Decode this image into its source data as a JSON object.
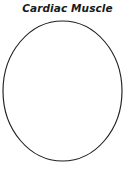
{
  "figure": {
    "title": "Cardiac Muscle",
    "background_color": "#ffffff",
    "outline_color": "#231f20",
    "fill_color": "#ffffff",
    "shape": {
      "name": "cell-outline",
      "type": "ellipse",
      "center_x": 62.5,
      "center_y": 91,
      "radius_x": 59.5,
      "radius_y": 70,
      "stroke_width": 1.15
    }
  }
}
